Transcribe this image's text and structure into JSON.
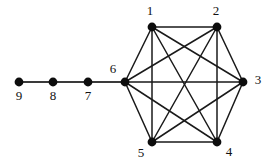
{
  "figure": {
    "background_color": "#ffffff",
    "ink_color": "#0d0d0d",
    "edge_color": "#1a1a1a",
    "path_edge_color": "#3a3a3a"
  },
  "chart_data": {
    "type": "diagram",
    "diagram_kind": "undirected-graph",
    "title": "",
    "vertex_count": 9,
    "edge_count": 18,
    "vertex_radius": 4.4,
    "nodes": [
      {
        "id": "1",
        "label": "1",
        "x": 152,
        "y": 27,
        "label_x": 150,
        "label_y": 12,
        "label_anchor": "middle"
      },
      {
        "id": "2",
        "label": "2",
        "x": 217,
        "y": 27,
        "label_x": 216,
        "label_y": 12,
        "label_anchor": "middle"
      },
      {
        "id": "3",
        "label": "3",
        "x": 243,
        "y": 82,
        "label_x": 258,
        "label_y": 81,
        "label_anchor": "middle"
      },
      {
        "id": "4",
        "label": "4",
        "x": 217,
        "y": 142,
        "label_x": 229,
        "label_y": 153,
        "label_anchor": "middle"
      },
      {
        "id": "5",
        "label": "5",
        "x": 152,
        "y": 142,
        "label_x": 141,
        "label_y": 154,
        "label_anchor": "middle"
      },
      {
        "id": "6",
        "label": "6",
        "x": 125,
        "y": 82,
        "label_x": 113,
        "label_y": 70,
        "label_anchor": "middle"
      },
      {
        "id": "7",
        "label": "7",
        "x": 88,
        "y": 82,
        "label_x": 88,
        "label_y": 97,
        "label_anchor": "middle"
      },
      {
        "id": "8",
        "label": "8",
        "x": 53,
        "y": 82,
        "label_x": 53,
        "label_y": 97,
        "label_anchor": "middle"
      },
      {
        "id": "9",
        "label": "9",
        "x": 19,
        "y": 82,
        "label_x": 19,
        "label_y": 97,
        "label_anchor": "middle"
      }
    ],
    "edges": [
      {
        "from": "1",
        "to": "2",
        "kind": "clique"
      },
      {
        "from": "1",
        "to": "3",
        "kind": "clique"
      },
      {
        "from": "1",
        "to": "4",
        "kind": "clique"
      },
      {
        "from": "1",
        "to": "5",
        "kind": "clique"
      },
      {
        "from": "1",
        "to": "6",
        "kind": "clique"
      },
      {
        "from": "2",
        "to": "3",
        "kind": "clique"
      },
      {
        "from": "2",
        "to": "4",
        "kind": "clique"
      },
      {
        "from": "2",
        "to": "5",
        "kind": "clique"
      },
      {
        "from": "2",
        "to": "6",
        "kind": "clique"
      },
      {
        "from": "3",
        "to": "4",
        "kind": "clique"
      },
      {
        "from": "3",
        "to": "5",
        "kind": "clique"
      },
      {
        "from": "3",
        "to": "6",
        "kind": "clique"
      },
      {
        "from": "4",
        "to": "5",
        "kind": "clique"
      },
      {
        "from": "4",
        "to": "6",
        "kind": "clique"
      },
      {
        "from": "5",
        "to": "6",
        "kind": "clique"
      },
      {
        "from": "6",
        "to": "7",
        "kind": "path"
      },
      {
        "from": "7",
        "to": "8",
        "kind": "path"
      },
      {
        "from": "8",
        "to": "9",
        "kind": "path"
      }
    ]
  }
}
